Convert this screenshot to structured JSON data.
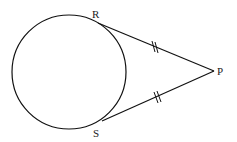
{
  "diagram": {
    "type": "circle-with-two-tangents",
    "circle": {
      "cx": 69,
      "cy": 72,
      "r": 57
    },
    "points": {
      "R": {
        "label": "R",
        "x": 98,
        "y": 23,
        "lx": 92,
        "ly": 17
      },
      "S": {
        "label": "S",
        "x": 102,
        "y": 121,
        "lx": 93,
        "ly": 137
      },
      "P": {
        "label": "P",
        "x": 214,
        "y": 71,
        "lx": 217,
        "ly": 74
      }
    },
    "segments": [
      {
        "from": "R",
        "to": "P",
        "tick_marks": 2
      },
      {
        "from": "S",
        "to": "P",
        "tick_marks": 2
      }
    ],
    "stroke_color": "#111111"
  }
}
